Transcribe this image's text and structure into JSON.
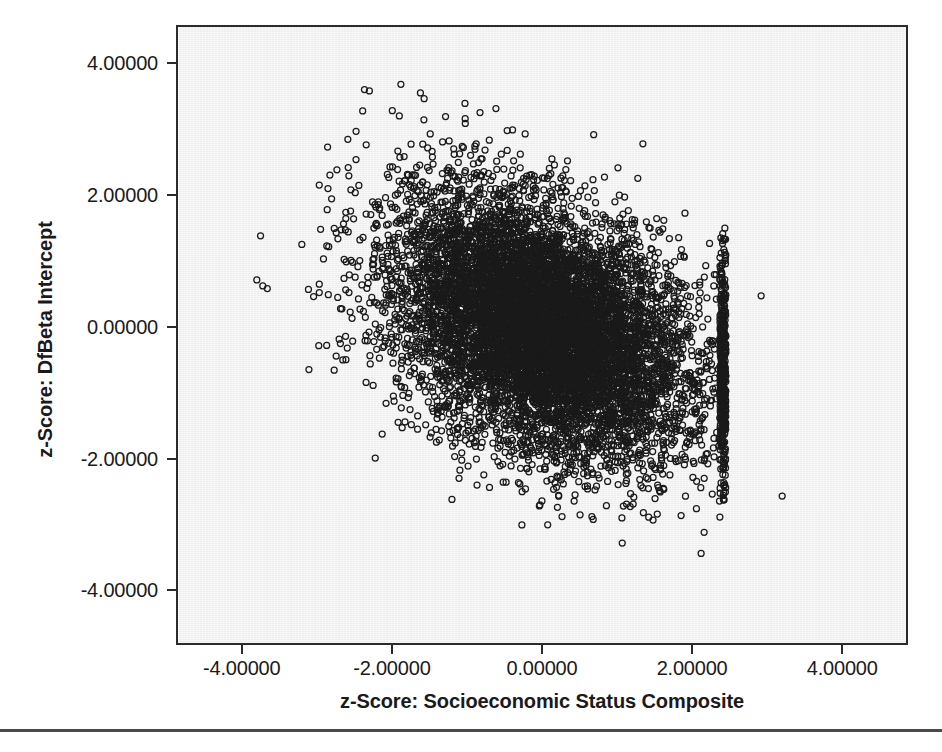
{
  "figure": {
    "type": "scatterplot",
    "background_color": "#ffffff",
    "panel_color": "#ededed",
    "frame_color": "#2b2b2b",
    "marker_color": "#1a1a1a"
  },
  "axes": {
    "x_title": "z-Score: Socioeconomic Status Composite",
    "y_title": "z-Score: DfBeta Intercept",
    "x_ticks": [
      "-4.00000",
      "-2.00000",
      "0.00000",
      "2.00000",
      "4.00000"
    ],
    "y_ticks": [
      "4.00000",
      "2.00000",
      "0.00000",
      "-2.00000",
      "-4.00000"
    ]
  },
  "chart_data": {
    "type": "scatter",
    "title": "",
    "xlabel": "z-Score: Socioeconomic Status Composite",
    "ylabel": "z-Score: DfBeta Intercept",
    "xlim": [
      -4.85,
      4.85
    ],
    "ylim": [
      -4.8,
      4.55
    ],
    "xticks": [
      -4,
      -2,
      0,
      2,
      4
    ],
    "yticks": [
      -4,
      -2,
      0,
      2,
      4
    ],
    "xtick_labels": [
      "-4.00000",
      "-2.00000",
      "0.00000",
      "2.00000",
      "4.00000"
    ],
    "ytick_labels": [
      "-4.00000",
      "-2.00000",
      "0.00000",
      "2.00000",
      "4.00000"
    ],
    "grid": false,
    "legend": false,
    "marker": "open-circle",
    "marker_size_px": 6,
    "marker_edge_color": "#1a1a1a",
    "marker_fill": "none",
    "n_points_approx": 9000,
    "correlation_approx": -0.35,
    "cloud": {
      "x_mean": 0.0,
      "x_sd": 0.98,
      "y_mean": 0.0,
      "y_sd": 0.98,
      "x_hard_max": 2.45,
      "x_hard_min": -3.15,
      "y_observed_range": [
        -3.45,
        3.75
      ],
      "x_observed_range": [
        -3.75,
        3.2
      ],
      "description": "Dense elliptical cloud tilted with negative slope; sharp vertical truncation of the socioeconomic status variable near z = +2.45; sparse left tail reaching z = -3.2; a handful of isolated outliers."
    },
    "outliers": [
      {
        "x": -3.75,
        "y": 1.38
      },
      {
        "x": -3.8,
        "y": 0.71
      },
      {
        "x": -3.72,
        "y": 0.62
      },
      {
        "x": -3.66,
        "y": 0.58
      },
      {
        "x": -3.2,
        "y": 1.25
      },
      {
        "x": -2.95,
        "y": 1.48
      },
      {
        "x": -2.62,
        "y": 1.47
      },
      {
        "x": -2.3,
        "y": 3.58
      },
      {
        "x": -1.88,
        "y": 3.68
      },
      {
        "x": -1.62,
        "y": 3.55
      },
      {
        "x": 2.92,
        "y": 0.47
      },
      {
        "x": 3.2,
        "y": -2.57
      },
      {
        "x": 2.16,
        "y": -3.12
      },
      {
        "x": 2.12,
        "y": -3.44
      },
      {
        "x": -1.2,
        "y": -2.62
      }
    ]
  }
}
